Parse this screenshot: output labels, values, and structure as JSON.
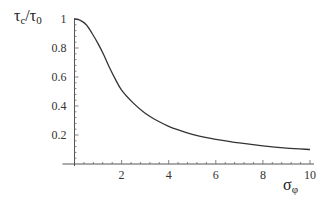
{
  "chart_data": {
    "type": "line",
    "title": "",
    "xlabel": "σφ",
    "ylabel": "τc/τ0",
    "xlabel_parts": {
      "main": "σ",
      "sub": "φ"
    },
    "ylabel_parts": {
      "main1": "τ",
      "sub1": "c",
      "slash": "/",
      "main2": "τ",
      "sub2": "0"
    },
    "xlim": [
      0,
      10
    ],
    "ylim": [
      0,
      1
    ],
    "x_ticks": [
      2,
      4,
      6,
      8,
      10
    ],
    "x_tick_labels": [
      "2",
      "4",
      "6",
      "8",
      "10"
    ],
    "y_ticks": [
      0.2,
      0.4,
      0.6,
      0.8,
      1
    ],
    "y_tick_labels": [
      "0.2",
      "0.4",
      "0.6",
      "0.8",
      "1"
    ],
    "grid": false,
    "legend": null,
    "series": [
      {
        "name": "τc/τ0",
        "color": "#333333",
        "x": [
          0,
          0.25,
          0.5,
          0.75,
          1,
          1.25,
          1.5,
          1.75,
          2,
          2.5,
          3,
          3.5,
          4,
          4.5,
          5,
          5.5,
          6,
          7,
          8,
          9,
          10
        ],
        "y": [
          1.0,
          0.99,
          0.96,
          0.9,
          0.83,
          0.75,
          0.66,
          0.58,
          0.51,
          0.42,
          0.35,
          0.3,
          0.26,
          0.23,
          0.205,
          0.185,
          0.17,
          0.145,
          0.125,
          0.11,
          0.1
        ]
      }
    ]
  }
}
